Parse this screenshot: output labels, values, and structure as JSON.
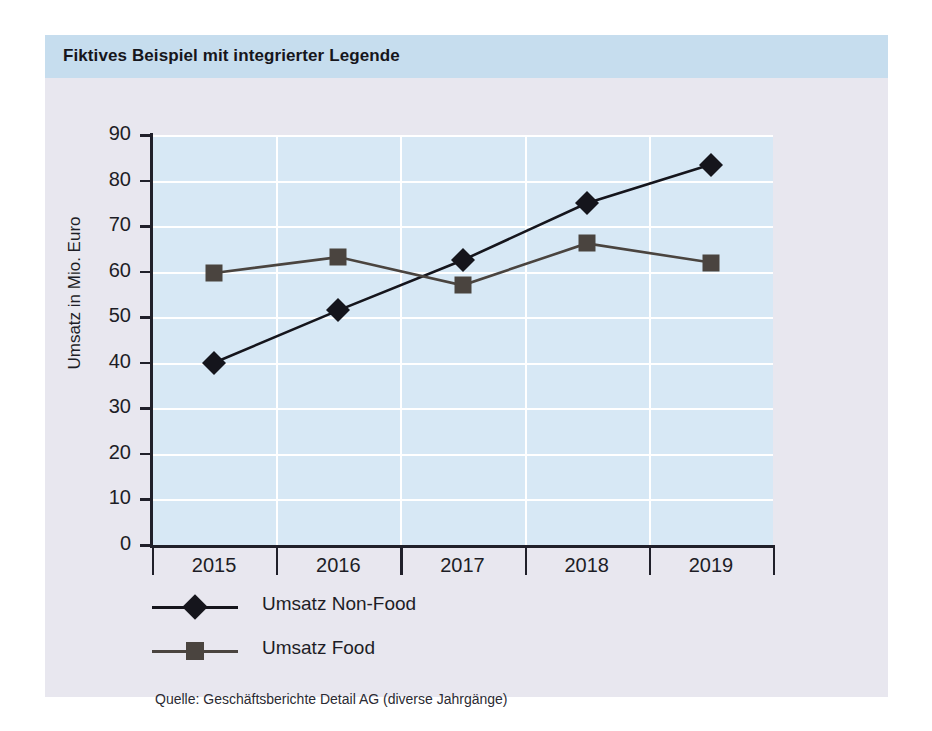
{
  "chart_title": "Fiktives Beispiel mit integrierter Legende",
  "source_note": "Quelle: Geschäftsberichte Detail AG (diverse Jahrgänge)",
  "colors": {
    "header_bar": "#c6ddee",
    "card_body": "#e8e7ef",
    "plot_background": "#d7e8f5",
    "gridline": "#ffffff",
    "axis": "#20202a",
    "series_non_food": "#15151c",
    "series_food": "#4a443f"
  },
  "chart_data": {
    "type": "line",
    "title": "Fiktives Beispiel mit integrierter Legende",
    "xlabel": "",
    "ylabel": "Umsatz in Mio. Euro",
    "categories": [
      "2015",
      "2016",
      "2017",
      "2018",
      "2019"
    ],
    "ylim": [
      0,
      90
    ],
    "yticks": [
      0,
      10,
      20,
      30,
      40,
      50,
      60,
      70,
      80,
      90
    ],
    "ytick_labels": [
      "0",
      "10",
      "20",
      "30",
      "40",
      "50",
      "60",
      "70",
      "80",
      "90"
    ],
    "grid": true,
    "legend_position": "below-plot-left",
    "series": [
      {
        "name": "Umsatz Non-Food",
        "marker": "diamond",
        "color": "#15151c",
        "values": [
          40,
          51.5,
          62.5,
          75,
          83.5
        ]
      },
      {
        "name": "Umsatz Food",
        "marker": "square",
        "color": "#4a443f",
        "values": [
          59.7,
          63.2,
          57,
          66.2,
          62
        ]
      }
    ]
  }
}
